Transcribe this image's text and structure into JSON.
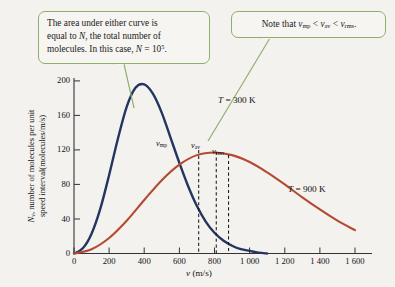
{
  "figure": {
    "background_color": "#f4f2ef",
    "callout_border_color": "#8fae6a"
  },
  "callouts": {
    "left": {
      "line1": "The area under either curve is",
      "line2_a": "equal to ",
      "line2_b": "N",
      "line2_c": ", the total number of",
      "line3_a": "molecules. In this case, ",
      "line3_b": "N",
      "line3_c": " = 10",
      "line3_sup": "5",
      "line3_d": "."
    },
    "right": {
      "prefix": "Note that ",
      "v1": "v",
      "v1_sub": "mp",
      "op1": " < ",
      "v2": "v",
      "v2_sub": "av",
      "op2": " < ",
      "v3": "v",
      "v3_sub": "rms",
      "suffix": "."
    }
  },
  "chart_data": {
    "type": "line",
    "title": "",
    "xlabel": "v (m/s)",
    "xlabel_italic": "v",
    "xlabel_unit": " (m/s)",
    "ylabel": "N_v, number of molecules per unit speed interval(molecules/m/s)",
    "ylabel_sym": "N",
    "ylabel_sym_sub": "v",
    "ylabel_rest": ", number of molecules per unit",
    "ylabel_line2": "speed interval(molecules/m/s)",
    "xlim": [
      0,
      1700
    ],
    "ylim": [
      0,
      215
    ],
    "xticks": [
      0,
      200,
      400,
      600,
      800,
      1000,
      1200,
      1400,
      1600
    ],
    "xtick_labels": [
      "0",
      "200",
      "400",
      "600",
      "800",
      "1 000",
      "1 200",
      "1 400",
      "1 600"
    ],
    "yticks": [
      0,
      40,
      80,
      120,
      160,
      200
    ],
    "ytick_labels": [
      "0",
      "40",
      "80",
      "120",
      "160",
      "200"
    ],
    "grid": false,
    "legend_position": "inline-annotations",
    "series": [
      {
        "name": "T = 300 K",
        "label_sym": "T",
        "label_rest": " = 300 K",
        "color": "#24355f",
        "peak_x": 400,
        "peak_y": 196,
        "x": [
          0,
          50,
          100,
          150,
          200,
          250,
          300,
          350,
          400,
          450,
          500,
          550,
          600,
          650,
          700,
          750,
          800,
          850,
          900,
          950,
          1000,
          1050,
          1100
        ],
        "values": [
          0,
          6,
          23,
          52,
          91,
          133,
          170,
          192,
          196,
          185,
          163,
          134,
          105,
          78,
          55,
          37,
          24,
          15,
          9,
          5,
          3,
          1,
          0
        ]
      },
      {
        "name": "T = 900 K",
        "label_sym": "T",
        "label_rest": " = 900 K",
        "color": "#b44a32",
        "peak_x": 780,
        "peak_y": 117,
        "x": [
          0,
          100,
          200,
          300,
          400,
          500,
          600,
          700,
          800,
          900,
          1000,
          1100,
          1200,
          1300,
          1400,
          1500,
          1600
        ],
        "values": [
          0,
          5,
          18,
          38,
          62,
          85,
          103,
          114,
          117,
          114,
          106,
          94,
          80,
          65,
          51,
          38,
          27
        ]
      }
    ],
    "vertical_markers": [
      {
        "name": "v_mp",
        "sym": "v",
        "sub": "mp",
        "x": 710,
        "y_top": 120
      },
      {
        "name": "v_av",
        "sym": "v",
        "sub": "av",
        "x": 810,
        "y_top": 118
      },
      {
        "name": "v_rms",
        "sym": "v",
        "sub": "rms",
        "x": 880,
        "y_top": 114
      }
    ]
  }
}
